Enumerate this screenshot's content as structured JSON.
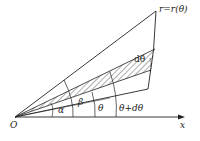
{
  "diagram": {
    "curve_label": "r=r(θ)",
    "origin_label": "O",
    "x_axis_label": "x",
    "angles": {
      "alpha": "α",
      "beta": "β",
      "theta": "θ",
      "theta_plus": "θ+dθ",
      "dtheta": "dθ"
    },
    "colors": {
      "line": "#222222",
      "background": "#ffffff"
    }
  }
}
